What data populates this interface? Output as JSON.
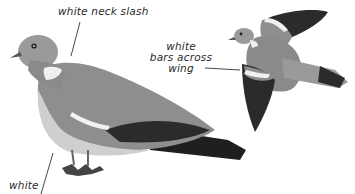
{
  "illustration": {
    "subject": "wood pigeon",
    "colors": {
      "body_grey": "#8e8e8e",
      "wing_dark": "#2b2b2b",
      "white_mark": "#f2f2f2",
      "belly_light": "#cfcfcf",
      "leader_line": "#333333"
    }
  },
  "labels": {
    "neck": "white neck slash",
    "wing_line1": "white",
    "wing_line2": "bars across",
    "wing_line3": "wing",
    "bottom": "white"
  }
}
